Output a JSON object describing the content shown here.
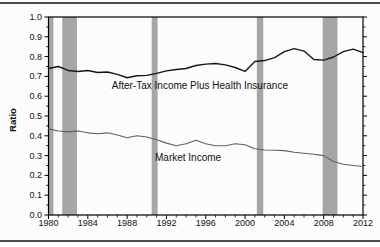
{
  "chart_data": {
    "type": "line",
    "title": "",
    "xlabel": "",
    "ylabel": "Ratio",
    "xlim": [
      1980,
      2012
    ],
    "ylim": [
      0.0,
      1.0
    ],
    "y_tick_step": 0.1,
    "y_minor_step": 0.05,
    "x_major_ticks": [
      1980,
      1984,
      1988,
      1992,
      1996,
      2000,
      2004,
      2008,
      2012
    ],
    "x_minor_step": 1,
    "grid": false,
    "legend": "inline-annotations",
    "frame_color": "#000000",
    "band_color": "#a6a6a6",
    "x": [
      1980,
      1981,
      1982,
      1983,
      1984,
      1985,
      1986,
      1987,
      1988,
      1989,
      1990,
      1991,
      1992,
      1993,
      1994,
      1995,
      1996,
      1997,
      1998,
      1999,
      2000,
      2001,
      2002,
      2003,
      2004,
      2005,
      2006,
      2007,
      2008,
      2009,
      2010,
      2011,
      2012
    ],
    "series": [
      {
        "id": "after-tax-income-plus-health-insurance",
        "name": "After-Tax Income Plus Health Insurance",
        "color": "#161616",
        "width": 1.4,
        "values": [
          0.74,
          0.75,
          0.73,
          0.725,
          0.73,
          0.72,
          0.722,
          0.71,
          0.693,
          0.703,
          0.705,
          0.715,
          0.728,
          0.735,
          0.74,
          0.755,
          0.762,
          0.765,
          0.758,
          0.745,
          0.725,
          0.775,
          0.78,
          0.795,
          0.825,
          0.84,
          0.828,
          0.785,
          0.782,
          0.798,
          0.825,
          0.838,
          0.82
        ]
      },
      {
        "id": "market-income",
        "name": "Market Income",
        "color": "#5f5f5f",
        "width": 1.1,
        "values": [
          0.435,
          0.424,
          0.42,
          0.424,
          0.415,
          0.41,
          0.415,
          0.404,
          0.39,
          0.4,
          0.394,
          0.38,
          0.363,
          0.35,
          0.36,
          0.378,
          0.36,
          0.35,
          0.35,
          0.36,
          0.355,
          0.335,
          0.328,
          0.327,
          0.325,
          0.317,
          0.312,
          0.307,
          0.3,
          0.27,
          0.256,
          0.25,
          0.245
        ]
      }
    ],
    "annotations": [
      {
        "id": "after-tax-income-plus-health-insurance",
        "text": "After-Tax Income Plus Health Insurance",
        "x": 1995.4,
        "y": 0.636
      },
      {
        "id": "market-income",
        "text": "Market Income",
        "x": 1994.2,
        "y": 0.273
      }
    ],
    "recession_bands": [
      [
        1980.0,
        1980.5
      ],
      [
        1981.4,
        1982.9
      ],
      [
        1990.5,
        1991.1
      ],
      [
        2001.2,
        2001.85
      ],
      [
        2007.9,
        2009.4
      ]
    ]
  }
}
